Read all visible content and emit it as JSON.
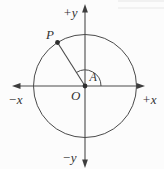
{
  "figure": {
    "description_labels": {
      "axis_plus_y": "+y",
      "axis_minus_y": "−y",
      "axis_minus_x": "−x",
      "axis_plus_x": "+x",
      "origin": "O",
      "point_p": "P",
      "angle_a": "A"
    },
    "colors": {
      "line": "#4a4a4a",
      "text": "#333333",
      "background": "#fcfcfc"
    },
    "geometry_notes": {
      "circle_center": "O at intersection of axes",
      "point_p_quadrant": "second quadrant on circle",
      "angle_a_sweep": "measured counterclockwise from +x axis to ray OP"
    }
  }
}
